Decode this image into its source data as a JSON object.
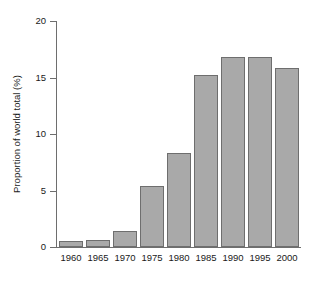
{
  "chart_data": {
    "type": "bar",
    "title": "",
    "subtitle": "",
    "xlabel": "",
    "ylabel": "Proportion of world total (%)",
    "categories": [
      "1960",
      "1965",
      "1970",
      "1975",
      "1980",
      "1985",
      "1990",
      "1995",
      "2000"
    ],
    "values": [
      0.5,
      0.6,
      1.4,
      5.4,
      8.3,
      15.2,
      16.8,
      16.8,
      15.8
    ],
    "series": [
      {
        "name": "Proportion of world total",
        "values": [
          0.5,
          0.6,
          1.4,
          5.4,
          8.3,
          15.2,
          16.8,
          16.8,
          15.8
        ]
      }
    ],
    "ylim": [
      0,
      20
    ],
    "yticks": [
      0,
      5,
      10,
      15,
      20
    ],
    "yticklabels": [
      "0",
      "5",
      "10",
      "15",
      "20"
    ],
    "xticklabels": [
      "1960",
      "1965",
      "1970",
      "1975",
      "1980",
      "1985",
      "1990",
      "1995",
      "2000"
    ],
    "grid": false,
    "legend": false,
    "legend_position": "none",
    "bar_color": "#a9a9a9",
    "bar_edge_color": "#6e6e6e",
    "axis_color": "#6e6e6e",
    "text_color": "#1a1a1a",
    "background_color": "#ffffff"
  }
}
